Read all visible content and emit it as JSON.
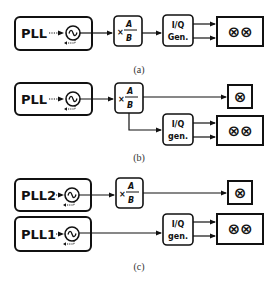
{
  "figure": {
    "panels": [
      {
        "caption": "(a)",
        "plls": [
          {
            "label": "PLL"
          }
        ],
        "divider": {
          "mult": "×",
          "numerator": "A",
          "denominator": "B"
        },
        "iq": {
          "line1": "I/Q",
          "line2": "Gen."
        },
        "mixers": {
          "pair": "⊗⊗"
        }
      },
      {
        "caption": "(b)",
        "plls": [
          {
            "label": "PLL"
          }
        ],
        "divider": {
          "mult": "×",
          "numerator": "A",
          "denominator": "B"
        },
        "iq": {
          "line1": "I/Q",
          "line2": "gen."
        },
        "mixers": {
          "single": "⊗",
          "pair": "⊗⊗"
        }
      },
      {
        "caption": "(c)",
        "plls": [
          {
            "label": "PLL2"
          },
          {
            "label": "PLL1"
          }
        ],
        "divider": {
          "mult": "×",
          "numerator": "A",
          "denominator": "B"
        },
        "iq": {
          "line1": "I/Q",
          "line2": "gen."
        },
        "mixers": {
          "single": "⊗",
          "pair": "⊗⊗"
        }
      }
    ],
    "colors": {
      "stroke": "#111111",
      "background": "#ffffff"
    }
  }
}
